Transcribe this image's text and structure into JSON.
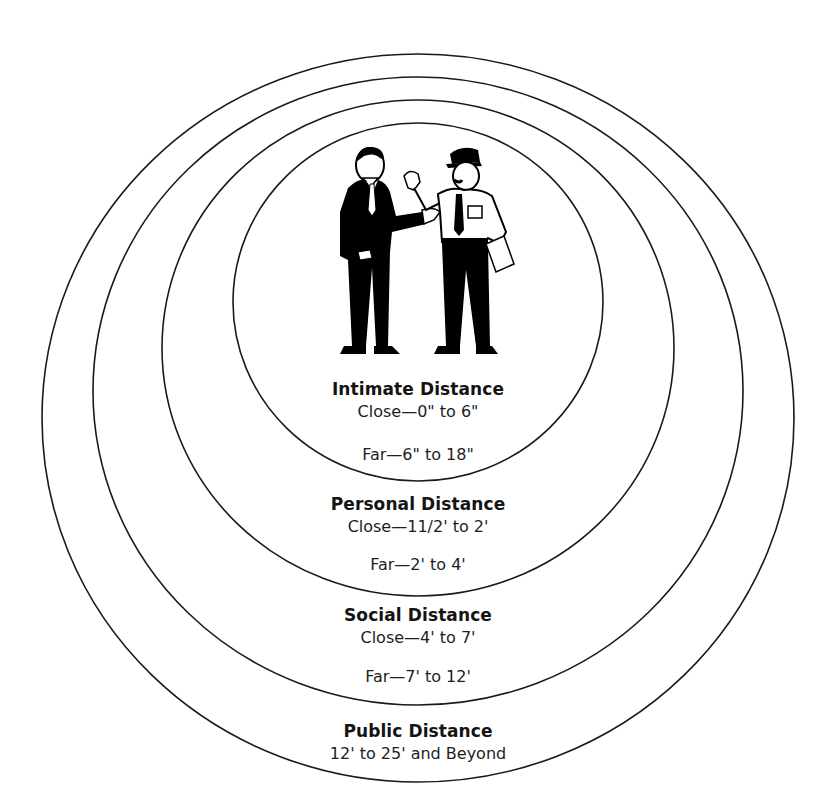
{
  "diagram": {
    "center_illustration": "man-in-suit-talking-to-police-officer",
    "colors": {
      "line": "#1a1a1a",
      "background": "#ffffff",
      "text": "#141414"
    },
    "zones": [
      {
        "name": "Intimate Distance",
        "ranges": [
          "Close—0\" to 6\"",
          "Far—6\" to 18\""
        ]
      },
      {
        "name": "Personal Distance",
        "ranges": [
          "Close—11/2' to 2'",
          "Far—2' to 4'"
        ]
      },
      {
        "name": "Social Distance",
        "ranges": [
          "Close—4' to 7'",
          "Far—7' to 12'"
        ]
      },
      {
        "name": "Public Distance",
        "ranges": [
          "12' to 25' and Beyond"
        ]
      }
    ]
  }
}
